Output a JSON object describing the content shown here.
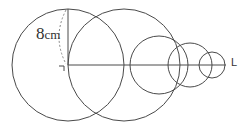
{
  "diagram": {
    "type": "geometry",
    "labels": {
      "length_value": "8",
      "length_unit": "cm",
      "line_name": "L"
    },
    "circles": [
      {
        "cx": 68,
        "cy": 65,
        "r": 56
      },
      {
        "cx": 124,
        "cy": 65,
        "r": 56
      },
      {
        "cx": 159,
        "cy": 65,
        "r": 29
      },
      {
        "cx": 190,
        "cy": 65,
        "r": 22
      },
      {
        "cx": 212,
        "cy": 65,
        "r": 13
      }
    ],
    "line_color": "#4a4a4a"
  }
}
